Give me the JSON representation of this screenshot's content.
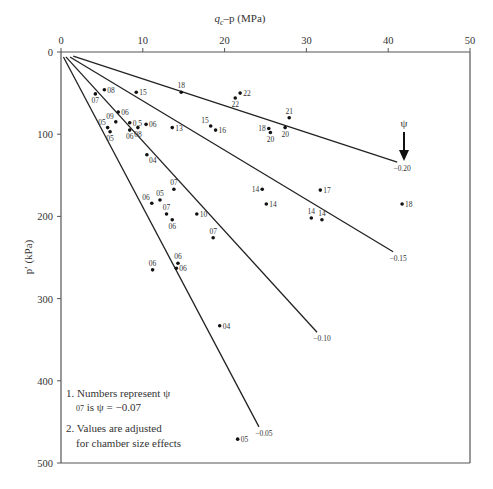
{
  "chart_data": {
    "type": "scatter",
    "xlabel": "q_c − p (MPa)",
    "xlabel_main": "q",
    "xlabel_sub": "c",
    "xlabel_rest": "–p (MPa)",
    "ylabel": "p′ (kPa)",
    "xlim": [
      0,
      50
    ],
    "ylim": [
      0,
      500
    ],
    "y_inverted": true,
    "x_axis_position": "top",
    "xticks": [
      0,
      10,
      20,
      30,
      40,
      50
    ],
    "yticks": [
      0,
      100,
      200,
      300,
      400,
      500
    ],
    "grid": false,
    "psi_marker": {
      "symbol": "ψ",
      "label": "−0.20"
    },
    "trend_lines": [
      {
        "label": "−0.20",
        "x": [
          1.5,
          41.1
        ],
        "y": [
          5,
          134
        ]
      },
      {
        "label": "−0.15",
        "x": [
          1.1,
          40.6
        ],
        "y": [
          6,
          243
        ]
      },
      {
        "label": "−0.10",
        "x": [
          0.6,
          31.3
        ],
        "y": [
          6,
          341
        ]
      },
      {
        "label": "−0.05",
        "x": [
          0.3,
          24.2
        ],
        "y": [
          6,
          456
        ]
      }
    ],
    "points": [
      {
        "x": 4.2,
        "y": 51,
        "label": "07",
        "pos": "below"
      },
      {
        "x": 5.3,
        "y": 46,
        "label": "08",
        "pos": "right"
      },
      {
        "x": 9.2,
        "y": 49,
        "label": "15",
        "pos": "right"
      },
      {
        "x": 14.7,
        "y": 49,
        "label": "18",
        "pos": "above"
      },
      {
        "x": 21.9,
        "y": 50,
        "label": "22",
        "pos": "right"
      },
      {
        "x": 21.3,
        "y": 56,
        "label": "22",
        "pos": "below"
      },
      {
        "x": 7.0,
        "y": 73,
        "label": "06",
        "pos": "right"
      },
      {
        "x": 6.7,
        "y": 85,
        "label": "09",
        "pos": "aboveleft"
      },
      {
        "x": 5.7,
        "y": 92,
        "label": "05",
        "pos": "aboveleft"
      },
      {
        "x": 8.4,
        "y": 86,
        "label": "0.5",
        "pos": "right"
      },
      {
        "x": 6.0,
        "y": 97,
        "label": "05",
        "pos": "below"
      },
      {
        "x": 8.4,
        "y": 95,
        "label": "06",
        "pos": "below"
      },
      {
        "x": 9.4,
        "y": 92,
        "label": "08",
        "pos": "below"
      },
      {
        "x": 10.4,
        "y": 88,
        "label": "06",
        "pos": "right"
      },
      {
        "x": 13.6,
        "y": 92,
        "label": "13",
        "pos": "right"
      },
      {
        "x": 18.3,
        "y": 90,
        "label": "15",
        "pos": "aboveleft"
      },
      {
        "x": 18.9,
        "y": 95,
        "label": "16",
        "pos": "right"
      },
      {
        "x": 25.4,
        "y": 93,
        "label": "18",
        "pos": "left"
      },
      {
        "x": 25.6,
        "y": 98,
        "label": "20",
        "pos": "below"
      },
      {
        "x": 27.9,
        "y": 80,
        "label": "21",
        "pos": "above"
      },
      {
        "x": 27.4,
        "y": 92,
        "label": "20",
        "pos": "below"
      },
      {
        "x": 10.5,
        "y": 125,
        "label": "04",
        "pos": "belowright"
      },
      {
        "x": 13.8,
        "y": 167,
        "label": "07",
        "pos": "above"
      },
      {
        "x": 11.1,
        "y": 184,
        "label": "06",
        "pos": "aboveleft"
      },
      {
        "x": 12.1,
        "y": 180,
        "label": "05",
        "pos": "above"
      },
      {
        "x": 12.9,
        "y": 197,
        "label": "07",
        "pos": "above"
      },
      {
        "x": 13.6,
        "y": 204,
        "label": "06",
        "pos": "below"
      },
      {
        "x": 16.6,
        "y": 197,
        "label": "10",
        "pos": "right"
      },
      {
        "x": 18.6,
        "y": 226,
        "label": "07",
        "pos": "above"
      },
      {
        "x": 24.6,
        "y": 167,
        "label": "14",
        "pos": "left"
      },
      {
        "x": 31.7,
        "y": 168,
        "label": "17",
        "pos": "right"
      },
      {
        "x": 25.1,
        "y": 185,
        "label": "14",
        "pos": "right"
      },
      {
        "x": 30.6,
        "y": 202,
        "label": "14",
        "pos": "above"
      },
      {
        "x": 31.9,
        "y": 204,
        "label": "14",
        "pos": "above"
      },
      {
        "x": 41.7,
        "y": 185,
        "label": "18",
        "pos": "right"
      },
      {
        "x": 11.2,
        "y": 265,
        "label": "06",
        "pos": "above"
      },
      {
        "x": 14.3,
        "y": 257,
        "label": "06",
        "pos": "above"
      },
      {
        "x": 14.1,
        "y": 263,
        "label": "06",
        "pos": "right"
      },
      {
        "x": 19.4,
        "y": 333,
        "label": "04",
        "pos": "right"
      },
      {
        "x": 21.6,
        "y": 471,
        "label": "05",
        "pos": "right"
      }
    ],
    "notes": [
      "1. Numbers represent ψ",
      "07 is ψ = −0.07",
      "2. Values are adjusted",
      "for chamber size effects"
    ]
  },
  "notes": {
    "n1": "1. Numbers represent ψ",
    "n1_small": "07",
    "n1b": " is ψ = −0.07",
    "n2": "2. Values are adjusted",
    "n2b": "for chamber size effects"
  },
  "axes": {
    "x_label_q": "q",
    "x_label_sub": "c",
    "x_label_rest": "–p (MPa)",
    "y_label": "p′ (kPa)",
    "psi": "ψ"
  }
}
